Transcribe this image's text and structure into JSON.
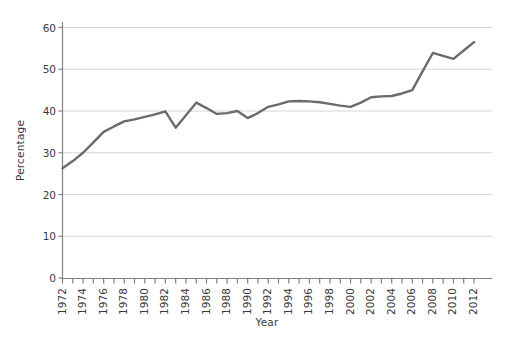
{
  "chart_data": {
    "type": "line",
    "title": "",
    "xlabel": "Year",
    "ylabel": "Percentage",
    "xlim": [
      1972,
      2012
    ],
    "ylim": [
      0,
      62
    ],
    "grid": true,
    "grid_axis": "y",
    "legend": "none",
    "series_color": "#6b6b6b",
    "x": [
      1972,
      1973,
      1974,
      1975,
      1976,
      1977,
      1978,
      1979,
      1980,
      1981,
      1982,
      1983,
      1984,
      1985,
      1986,
      1987,
      1988,
      1989,
      1990,
      1991,
      1992,
      1993,
      1994,
      1995,
      1996,
      1997,
      1998,
      1999,
      2000,
      2001,
      2002,
      2003,
      2004,
      2005,
      2006,
      2007,
      2008,
      2009,
      2010,
      2011,
      2012
    ],
    "values": [
      26.3,
      28.0,
      30.0,
      32.5,
      35.0,
      36.3,
      37.5,
      38.0,
      38.6,
      39.2,
      39.9,
      36.0,
      39.0,
      42.0,
      40.7,
      39.3,
      39.5,
      40.0,
      38.3,
      39.5,
      41.0,
      41.6,
      42.3,
      42.4,
      42.3,
      42.1,
      41.7,
      41.3,
      41.0,
      42.0,
      43.3,
      43.5,
      43.6,
      44.2,
      45.0,
      49.5,
      53.9,
      53.2,
      52.5,
      54.5,
      56.5
    ],
    "ytick_labels": [
      "0",
      "10",
      "20",
      "30",
      "40",
      "50",
      "60"
    ],
    "ytick_values": [
      0,
      10,
      20,
      30,
      40,
      50,
      60
    ],
    "xtick_labels": [
      "1972",
      "1974",
      "1976",
      "1978",
      "1980",
      "1982",
      "1984",
      "1986",
      "1988",
      "1990",
      "1992",
      "1994",
      "1996",
      "1998",
      "2000",
      "2002",
      "2004",
      "2006",
      "2008",
      "2010",
      "2012"
    ],
    "xtick_values": [
      1972,
      1974,
      1976,
      1978,
      1980,
      1982,
      1984,
      1986,
      1988,
      1990,
      1992,
      1994,
      1996,
      1998,
      2000,
      2002,
      2004,
      2006,
      2008,
      2010,
      2012
    ],
    "xminor_values": [
      1973,
      1975,
      1977,
      1979,
      1981,
      1983,
      1985,
      1987,
      1989,
      1991,
      1993,
      1995,
      1997,
      1999,
      2001,
      2003,
      2005,
      2007,
      2009,
      2011
    ]
  }
}
